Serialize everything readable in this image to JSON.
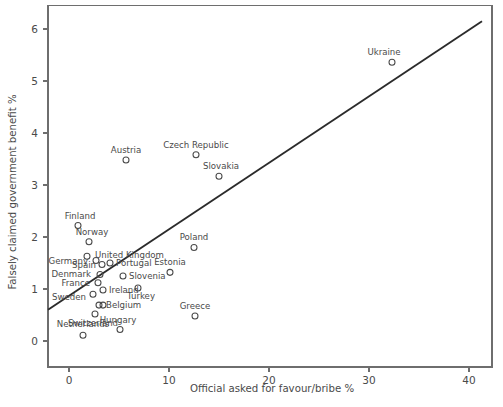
{
  "chart_data": {
    "type": "scatter",
    "title": "",
    "xlabel": "Official asked for favour/bribe %",
    "ylabel": "Falsely claimed government benefit %",
    "xlim": [
      -2.1,
      42.3
    ],
    "ylim": [
      -0.5,
      6.45
    ],
    "xticks": [
      0,
      10,
      20,
      30,
      40
    ],
    "xticklabels": [
      "0",
      "10",
      "20",
      "30",
      "40"
    ],
    "yticks": [
      0,
      1,
      2,
      3,
      4,
      5,
      6
    ],
    "yticklabels": [
      "0",
      "1",
      "2",
      "3",
      "4",
      "5",
      "6"
    ],
    "grid": false,
    "legend": null,
    "marker_style": "open-circle",
    "points": [
      {
        "name": "Ukraine",
        "x": 32.3,
        "y": 5.36,
        "label_dx": -8,
        "label_dy": -7,
        "label_anchor": "middle"
      },
      {
        "name": "Czech Republic",
        "x": 12.7,
        "y": 3.58,
        "label_dx": 0,
        "label_dy": -7,
        "label_anchor": "middle"
      },
      {
        "name": "Austria",
        "x": 5.7,
        "y": 3.48,
        "label_dx": 0,
        "label_dy": -7,
        "label_anchor": "middle"
      },
      {
        "name": "Slovakia",
        "x": 15.0,
        "y": 3.17,
        "label_dx": 2,
        "label_dy": -7,
        "label_anchor": "middle"
      },
      {
        "name": "Finland",
        "x": 0.9,
        "y": 2.22,
        "label_dx": 2,
        "label_dy": -7,
        "label_anchor": "middle"
      },
      {
        "name": "Norway",
        "x": 2.0,
        "y": 1.91,
        "label_dx": 3,
        "label_dy": -7,
        "label_anchor": "middle"
      },
      {
        "name": "Poland",
        "x": 12.5,
        "y": 1.8,
        "label_dx": 0,
        "label_dy": -7,
        "label_anchor": "middle"
      },
      {
        "name": "United Kingdom",
        "x": 1.8,
        "y": 1.63,
        "label_dx": 8,
        "label_dy": 2,
        "label_anchor": "start"
      },
      {
        "name": "Germany",
        "x": 2.7,
        "y": 1.55,
        "label_dx": -8,
        "label_dy": 4,
        "label_anchor": "end"
      },
      {
        "name": "Portugal",
        "x": 4.1,
        "y": 1.5,
        "label_dx": 6,
        "label_dy": 3,
        "label_anchor": "start"
      },
      {
        "name": "Spain",
        "x": 3.3,
        "y": 1.47,
        "label_dx": -6,
        "label_dy": 3,
        "label_anchor": "end"
      },
      {
        "name": "Estonia",
        "x": 10.1,
        "y": 1.32,
        "label_dx": 0,
        "label_dy": -7,
        "label_anchor": "middle"
      },
      {
        "name": "Denmark",
        "x": 3.1,
        "y": 1.28,
        "label_dx": -9,
        "label_dy": 3,
        "label_anchor": "end"
      },
      {
        "name": "Slovenia",
        "x": 5.4,
        "y": 1.25,
        "label_dx": 6,
        "label_dy": 3,
        "label_anchor": "start"
      },
      {
        "name": "France",
        "x": 2.9,
        "y": 1.12,
        "label_dx": -8,
        "label_dy": 3,
        "label_anchor": "end"
      },
      {
        "name": "Turkey",
        "x": 6.9,
        "y": 1.02,
        "label_dx": 3,
        "label_dy": 11,
        "label_anchor": "middle"
      },
      {
        "name": "Ireland",
        "x": 3.4,
        "y": 0.98,
        "label_dx": 6,
        "label_dy": 3,
        "label_anchor": "start"
      },
      {
        "name": "Sweden",
        "x": 2.4,
        "y": 0.9,
        "label_dx": -7,
        "label_dy": 6,
        "label_anchor": "end"
      },
      {
        "name": "Belgium",
        "x": 3.0,
        "y": 0.69,
        "label_dx": 7,
        "label_dy": 3,
        "label_anchor": "start"
      },
      {
        "name": "Belgium-b",
        "x": 3.4,
        "y": 0.69,
        "label_dx": 0,
        "label_dy": 0,
        "label_anchor": "none"
      },
      {
        "name": "Switzerland",
        "x": 2.6,
        "y": 0.52,
        "label_dx": -2,
        "label_dy": 12,
        "label_anchor": "middle"
      },
      {
        "name": "Greece",
        "x": 12.6,
        "y": 0.48,
        "label_dx": 0,
        "label_dy": -7,
        "label_anchor": "middle"
      },
      {
        "name": "Hungary",
        "x": 5.1,
        "y": 0.22,
        "label_dx": -2,
        "label_dy": -7,
        "label_anchor": "middle"
      },
      {
        "name": "Netherlands",
        "x": 1.4,
        "y": 0.11,
        "label_dx": 0,
        "label_dy": -8,
        "label_anchor": "middle"
      }
    ],
    "trend_line": {
      "label": "fitted-trend-line",
      "x_start": -2.1,
      "y_start": 0.6,
      "x_end": 41.3,
      "y_end": 6.15
    }
  }
}
